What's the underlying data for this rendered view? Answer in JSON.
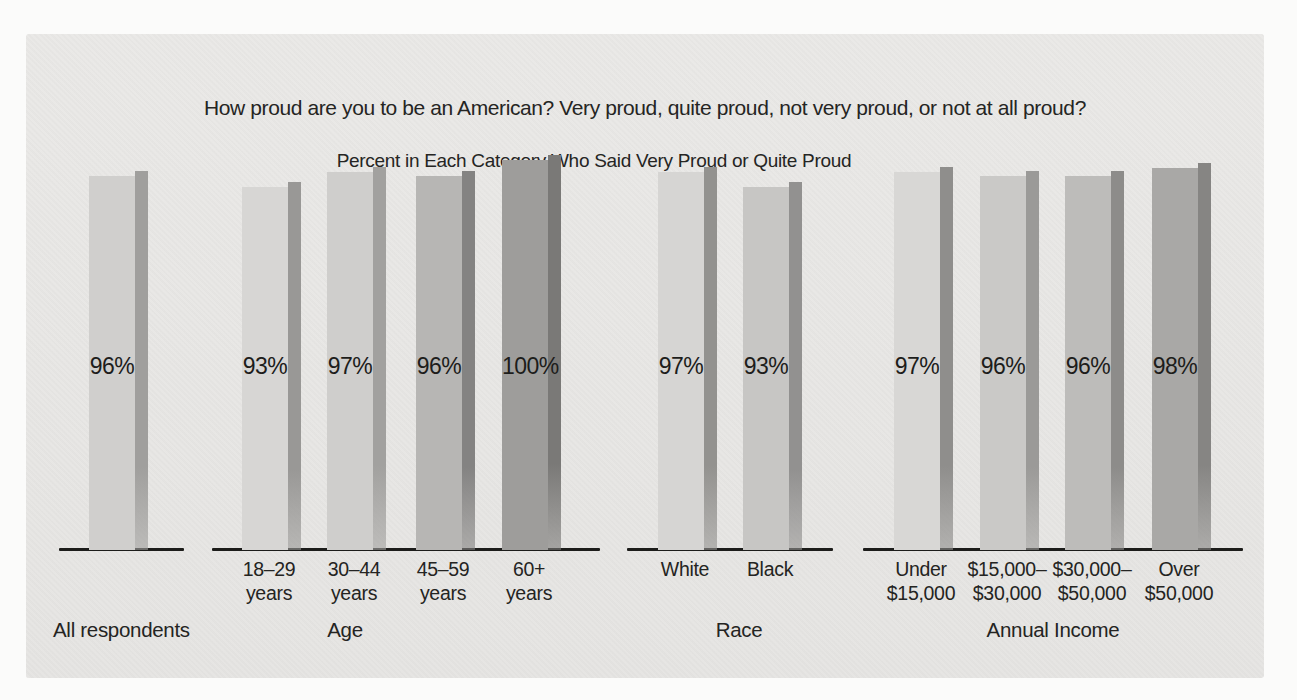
{
  "page": {
    "background": "#fbfbfa",
    "panel_background": "#e8e7e5",
    "axis_color": "#1c1c1a",
    "text_color": "#242422"
  },
  "chart_data": {
    "type": "bar",
    "title": "How proud are you to be an American? Very proud, quite proud, not very proud, or not at all proud?",
    "subtitle": "Percent in Each Category Who Said Very Proud or Quite Proud",
    "xlabel": "",
    "ylabel": "",
    "unit": "%",
    "ylim": [
      0,
      100
    ],
    "grid": false,
    "legend": false,
    "value_labels_inside_bars": true,
    "groups": [
      {
        "label": "All respondents",
        "bars": [
          {
            "tick_line1": "",
            "tick_line2": "",
            "value": 96,
            "value_label": "96%",
            "fill": "#d0cfcd",
            "shadow": "#a09f9d"
          }
        ]
      },
      {
        "label": "Age",
        "bars": [
          {
            "tick_line1": "18–29",
            "tick_line2": "years",
            "value": 93,
            "value_label": "93%",
            "fill": "#d7d6d4",
            "shadow": "#999896"
          },
          {
            "tick_line1": "30–44",
            "tick_line2": "years",
            "value": 97,
            "value_label": "97%",
            "fill": "#cfcecc",
            "shadow": "#a2a19f"
          },
          {
            "tick_line1": "45–59",
            "tick_line2": "years",
            "value": 96,
            "value_label": "96%",
            "fill": "#b7b6b4",
            "shadow": "#848382"
          },
          {
            "tick_line1": "60+",
            "tick_line2": "years",
            "value": 100,
            "value_label": "100%",
            "fill": "#9e9d9b",
            "shadow": "#7a7977"
          }
        ]
      },
      {
        "label": "Race",
        "bars": [
          {
            "tick_line1": "White",
            "tick_line2": "",
            "value": 97,
            "value_label": "97%",
            "fill": "#d6d5d3",
            "shadow": "#93928f"
          },
          {
            "tick_line1": "Black",
            "tick_line2": "",
            "value": 93,
            "value_label": "93%",
            "fill": "#c7c6c4",
            "shadow": "#929190"
          }
        ]
      },
      {
        "label": "Annual Income",
        "bars": [
          {
            "tick_line1": "Under",
            "tick_line2": "$15,000",
            "value": 97,
            "value_label": "97%",
            "fill": "#d8d7d5",
            "shadow": "#8f8e8c"
          },
          {
            "tick_line1": "$15,000–",
            "tick_line2": "$30,000",
            "value": 96,
            "value_label": "96%",
            "fill": "#cac9c7",
            "shadow": "#9b9a98"
          },
          {
            "tick_line1": "$30,000–",
            "tick_line2": "$50,000",
            "value": 96,
            "value_label": "96%",
            "fill": "#bdbcba",
            "shadow": "#8d8c8a"
          },
          {
            "tick_line1": "Over",
            "tick_line2": "$50,000",
            "value": 98,
            "value_label": "98%",
            "fill": "#a9a8a6",
            "shadow": "#868583"
          }
        ]
      }
    ]
  }
}
